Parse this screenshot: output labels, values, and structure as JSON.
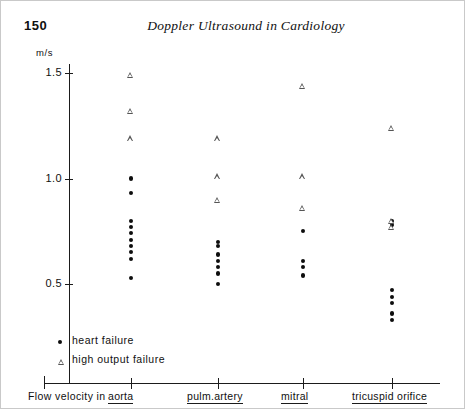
{
  "page": {
    "number": "150",
    "running_title": "Doppler Ultrasound in Cardiology"
  },
  "axes": {
    "unit_label": "m/s",
    "caption": "Flow velocity in",
    "y_ticks": [
      "1.5",
      "1.0",
      "0.5"
    ],
    "categories": [
      "aorta",
      "pulm.artery",
      "mitral",
      "tricuspid orifice"
    ]
  },
  "legend": {
    "items": [
      {
        "marker": "filled-dot",
        "label": "heart failure"
      },
      {
        "marker": "open-triangle",
        "label": "high output failure"
      }
    ]
  },
  "chart_data": {
    "type": "scatter",
    "title": "Doppler Ultrasound in Cardiology",
    "xlabel": "Flow velocity in",
    "ylabel": "m/s",
    "ylim": [
      0.3,
      1.6
    ],
    "ytick_values": [
      1.5,
      1.0,
      0.5
    ],
    "grid": false,
    "legend_position": "bottom-left",
    "categories": [
      "aorta",
      "pulm.artery",
      "mitral",
      "tricuspid orifice"
    ],
    "series": [
      {
        "name": "heart failure",
        "marker": "filled-dot",
        "color": "#0d0d0d",
        "points": {
          "aorta": [
            1.0,
            0.93,
            0.8,
            0.77,
            0.74,
            0.71,
            0.68,
            0.65,
            0.62,
            0.53
          ],
          "pulm.artery": [
            0.7,
            0.68,
            0.64,
            0.61,
            0.58,
            0.55,
            0.5
          ],
          "mitral": [
            0.75,
            0.61,
            0.58,
            0.54
          ],
          "tricuspid orifice": [
            0.8,
            0.78,
            0.47,
            0.44,
            0.41,
            0.36,
            0.33
          ]
        }
      },
      {
        "name": "high output failure",
        "marker": "open-triangle",
        "color": "#555555",
        "points": {
          "aorta": [
            1.49,
            1.32,
            1.19
          ],
          "pulm.artery": [
            1.19,
            1.01,
            0.9
          ],
          "mitral": [
            1.44,
            1.01,
            0.86
          ],
          "tricuspid orifice": [
            1.24,
            0.8,
            0.77
          ]
        }
      }
    ]
  }
}
